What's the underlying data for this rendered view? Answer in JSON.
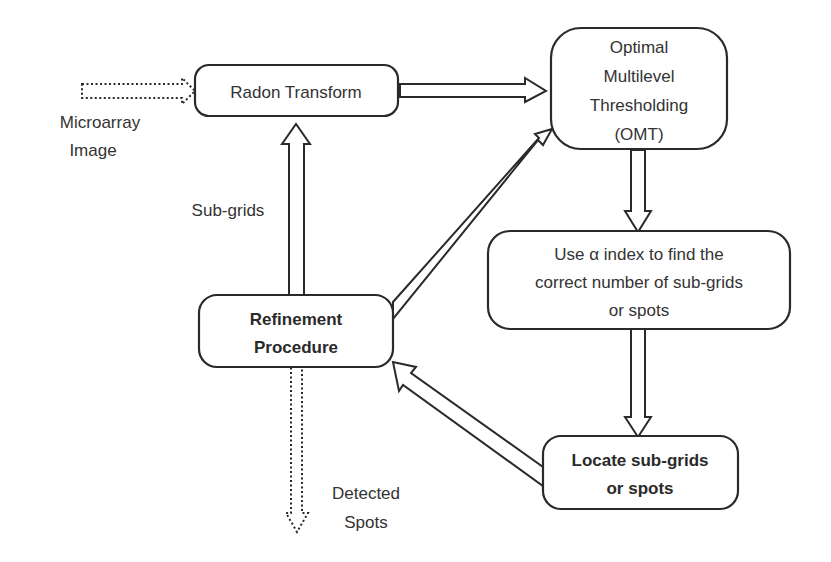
{
  "diagram": {
    "nodes": {
      "radon": {
        "label": "Radon Transform"
      },
      "omt": {
        "lines": [
          "Optimal",
          "Multilevel",
          "Thresholding",
          "(OMT)"
        ]
      },
      "alpha": {
        "lines": [
          "Use α index to find the",
          "correct number of sub-grids",
          "or spots"
        ]
      },
      "locate": {
        "lines": [
          "Locate sub-grids",
          "or spots"
        ]
      },
      "refine": {
        "lines": [
          "Refinement",
          "Procedure"
        ]
      }
    },
    "labels": {
      "input": [
        "Microarray",
        "Image"
      ],
      "subgrids": "Sub-grids",
      "output": [
        "Detected",
        "Spots"
      ]
    },
    "edges": [
      {
        "from": "input",
        "to": "radon",
        "style": "dotted"
      },
      {
        "from": "radon",
        "to": "omt",
        "style": "solid"
      },
      {
        "from": "omt",
        "to": "alpha",
        "style": "solid"
      },
      {
        "from": "alpha",
        "to": "locate",
        "style": "solid"
      },
      {
        "from": "locate",
        "to": "refine",
        "style": "solid"
      },
      {
        "from": "refine",
        "to": "omt",
        "style": "solid"
      },
      {
        "from": "refine",
        "to": "radon",
        "style": "solid",
        "label": "Sub-grids"
      },
      {
        "from": "refine",
        "to": "output",
        "style": "dotted"
      }
    ],
    "colors": {
      "stroke": "#2a2a2a",
      "text": "#333333",
      "background": "#ffffff"
    }
  }
}
